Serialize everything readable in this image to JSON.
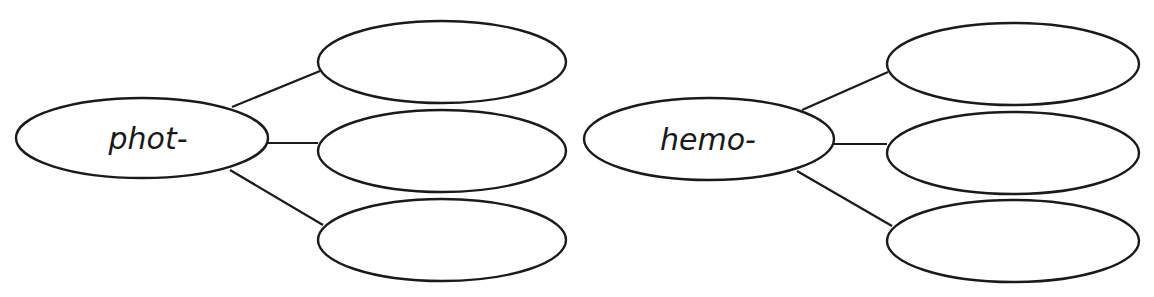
{
  "diagrams": [
    {
      "name": "phot-web",
      "center": {
        "label": "phot-",
        "cx": 142,
        "cy": 138,
        "rx": 126,
        "ry": 40
      },
      "branches": [
        {
          "label": "",
          "cx": 442,
          "cy": 62,
          "rx": 124,
          "ry": 41,
          "line": [
            232,
            107,
            320,
            71
          ]
        },
        {
          "label": "",
          "cx": 442,
          "cy": 151,
          "rx": 124,
          "ry": 41,
          "line": [
            268,
            143,
            318,
            143
          ]
        },
        {
          "label": "",
          "cx": 442,
          "cy": 240,
          "rx": 124,
          "ry": 41,
          "line": [
            230,
            170,
            323,
            225
          ]
        }
      ]
    },
    {
      "name": "hemo-web",
      "center": {
        "label": "hemo-",
        "cx": 709,
        "cy": 139,
        "rx": 125,
        "ry": 41
      },
      "branches": [
        {
          "label": "",
          "cx": 1013,
          "cy": 64,
          "rx": 126,
          "ry": 41,
          "line": [
            802,
            110,
            888,
            72
          ]
        },
        {
          "label": "",
          "cx": 1013,
          "cy": 153,
          "rx": 126,
          "ry": 41,
          "line": [
            834,
            144,
            887,
            144
          ]
        },
        {
          "label": "",
          "cx": 1013,
          "cy": 241,
          "rx": 126,
          "ry": 41,
          "line": [
            797,
            171,
            892,
            226
          ]
        }
      ]
    }
  ]
}
